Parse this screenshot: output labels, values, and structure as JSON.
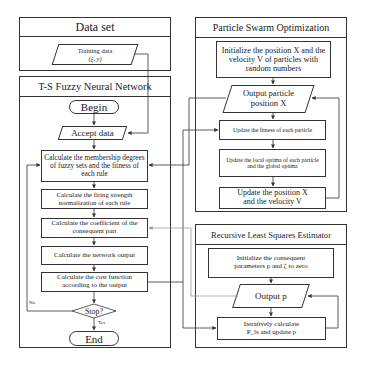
{
  "panels": {
    "data_set": {
      "title": "Data set",
      "training_data_line1": "Training data",
      "training_data_line2": "(ξ, y)"
    },
    "ts_fnn": {
      "title": "T-S Fuzzy Neural Network",
      "begin": "Begin",
      "accept_data": "Accept data",
      "membership": "Calculate the membership degrees of fuzzy sets and the fitness of each rule",
      "firing_strength": "Calculate the firing strength normalization of each rule",
      "coefficient": "Calculate the coefficient of the consequent part",
      "network_output": "Calculate the network output",
      "cost_function": "Calculate the cost function according to the output",
      "stop": "Stop?",
      "no_label": "No",
      "yes_label": "Yes",
      "end": "End"
    },
    "pso": {
      "title": "Particle Swarm Optimization",
      "init": "Initialize the position X and the velocity V of particles with random numbers",
      "output_line1": "Output particle",
      "output_line2": "position X",
      "update_fitness": "Update the fitness of each particle",
      "update_optima": "Update the local optima of each particle and the global optima",
      "update_position_line1": "Update the position X",
      "update_position_line2": "and the velocity V"
    },
    "rls": {
      "title": "Recursive Least Squares Estimator",
      "init": "Initialize the consequent parameters p and ζ to zero",
      "output": "Output p",
      "iterate_line1": "Iteratively calculate",
      "iterate_line2": "P_ls and update p"
    }
  },
  "colors": {
    "line": "#333333",
    "faint_line": "#9a9a9a",
    "background": "#ffffff"
  }
}
